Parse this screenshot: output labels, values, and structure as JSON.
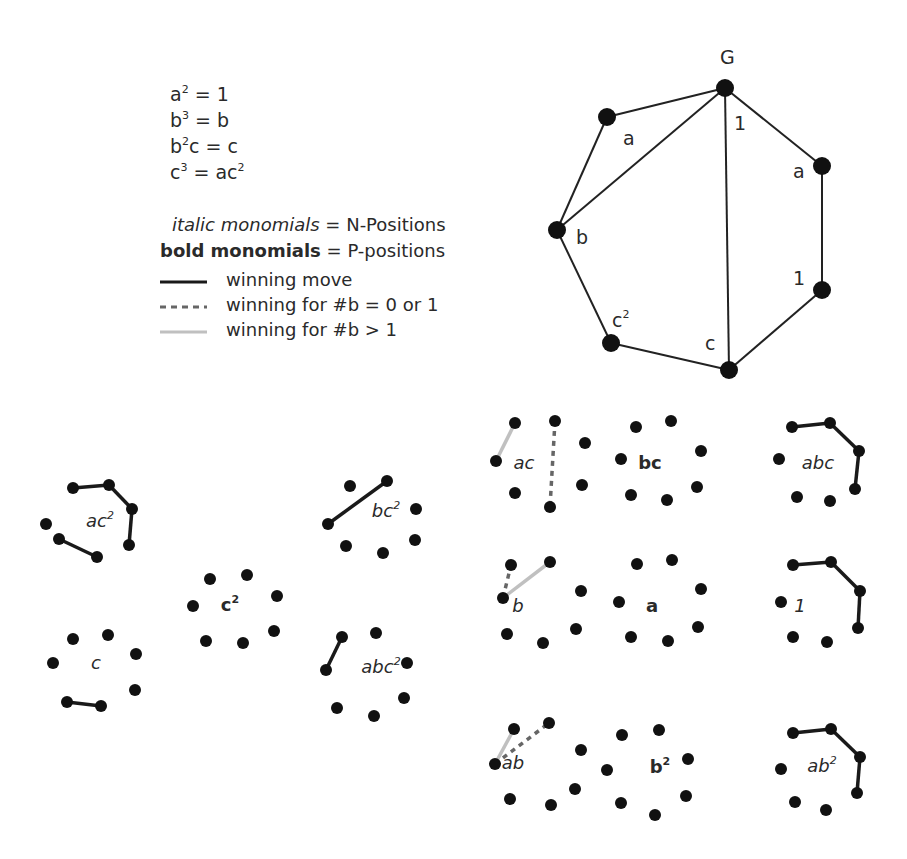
{
  "relations": [
    {
      "base": "a",
      "exp": "2",
      "rhs": "= 1"
    },
    {
      "base": "b",
      "exp": "3",
      "rhs": "= b"
    },
    {
      "base": "b",
      "exp": "2",
      "rhs": "c = c"
    },
    {
      "base": "c",
      "exp": "3",
      "rhs": "= ac²"
    }
  ],
  "key": {
    "italic_label": "italic monomials",
    "italic_value": "= N-Positions",
    "bold_label": "bold monomials",
    "bold_value": "= P-positions"
  },
  "line_legend": [
    {
      "style": "solid",
      "color": "#1a1a1a",
      "label": "winning move"
    },
    {
      "style": "dashed",
      "color": "#666666",
      "label": "winning for #b = 0 or 1"
    },
    {
      "style": "solid-light",
      "color": "#c0c0c0",
      "label": "winning for #b > 1"
    }
  ],
  "graph": {
    "title": "G",
    "node_labels": [
      "a",
      "b",
      "c²",
      "c",
      "1",
      "a",
      "1"
    ]
  },
  "positions": [
    {
      "name": "ac²",
      "type": "N"
    },
    {
      "name": "c",
      "type": "N"
    },
    {
      "name": "c²",
      "type": "P"
    },
    {
      "name": "bc²",
      "type": "N"
    },
    {
      "name": "abc²",
      "type": "N"
    },
    {
      "name": "ac",
      "type": "N"
    },
    {
      "name": "bc",
      "type": "P"
    },
    {
      "name": "abc",
      "type": "N"
    },
    {
      "name": "b",
      "type": "N"
    },
    {
      "name": "a",
      "type": "P"
    },
    {
      "name": "1",
      "type": "N"
    },
    {
      "name": "ab",
      "type": "N"
    },
    {
      "name": "b²",
      "type": "P"
    },
    {
      "name": "ab²",
      "type": "N"
    }
  ],
  "colors": {
    "node": "#111111",
    "solid": "#1a1a1a",
    "dashed": "#666666",
    "light": "#c0c0c0"
  }
}
